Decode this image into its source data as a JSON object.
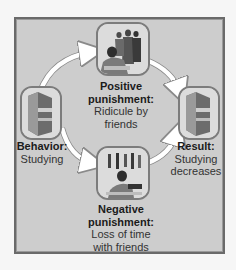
{
  "diagram": {
    "type": "cycle",
    "background_color": "#f6f6f6",
    "panel_color": "#cdcdcd",
    "arrow_color": "#ffffff",
    "nodes": [
      {
        "id": "behavior",
        "icon": "book-icon",
        "title": "Behavior:",
        "lines": [
          "Studying"
        ]
      },
      {
        "id": "positive",
        "icon": "students-ridicule-illustration",
        "title_lines": [
          "Positive",
          "punishment:"
        ],
        "lines": [
          "Ridicule by",
          "friends"
        ]
      },
      {
        "id": "negative",
        "icon": "student-studying-alone-illustration",
        "title_lines": [
          "Negative",
          "punishment:"
        ],
        "lines": [
          "Loss of time",
          "with friends"
        ]
      },
      {
        "id": "result",
        "icon": "book-icon",
        "title": "Result:",
        "lines": [
          "Studying",
          "decreases"
        ]
      }
    ],
    "edges": [
      {
        "from": "behavior",
        "to": "positive"
      },
      {
        "from": "positive",
        "to": "result"
      },
      {
        "from": "behavior",
        "to": "negative"
      },
      {
        "from": "negative",
        "to": "result"
      }
    ]
  }
}
